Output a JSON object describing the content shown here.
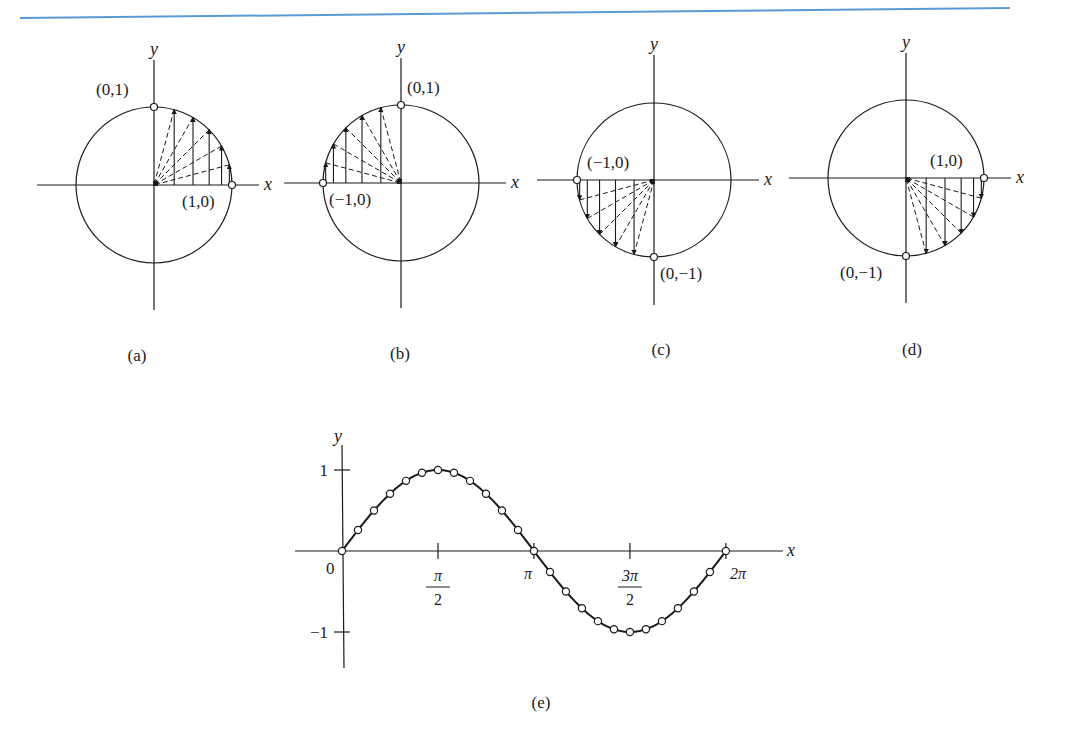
{
  "header_rule": {
    "color": "#5b9bd5"
  },
  "panels": [
    {
      "id": "a",
      "caption": "(a)",
      "cx": 154,
      "cy": 185,
      "r": 78,
      "axis_x_label": "x",
      "axis_y_label": "y",
      "quadrant": "I",
      "points": [
        {
          "label": "(0,1)",
          "angle_deg": 90,
          "label_dx": -58,
          "label_dy": -12
        },
        {
          "label": "(1,0)",
          "angle_deg": 0,
          "label_dx": -50,
          "label_dy": 22
        }
      ],
      "projection_angles_deg": [
        15,
        30,
        45,
        60,
        75
      ]
    },
    {
      "id": "b",
      "caption": "(b)",
      "cx": 401,
      "cy": 183,
      "r": 78,
      "axis_x_label": "x",
      "axis_y_label": "y",
      "quadrant": "II",
      "points": [
        {
          "label": "(0,1)",
          "angle_deg": 90,
          "label_dx": 6,
          "label_dy": -12
        },
        {
          "label": "(−1,0)",
          "angle_deg": 180,
          "label_dx": 6,
          "label_dy": 22
        }
      ],
      "projection_angles_deg": [
        105,
        120,
        135,
        150,
        165
      ]
    },
    {
      "id": "c",
      "caption": "(c)",
      "cx": 654,
      "cy": 180,
      "r": 77,
      "axis_x_label": "x",
      "axis_y_label": "y",
      "quadrant": "III",
      "points": [
        {
          "label": "(−1,0)",
          "angle_deg": 180,
          "label_dx": 10,
          "label_dy": -12
        },
        {
          "label": "(0,−1)",
          "angle_deg": 270,
          "label_dx": 6,
          "label_dy": 22
        }
      ],
      "projection_angles_deg": [
        195,
        210,
        225,
        240,
        255
      ]
    },
    {
      "id": "d",
      "caption": "(d)",
      "cx": 906,
      "cy": 178,
      "r": 78,
      "axis_x_label": "x",
      "axis_y_label": "y",
      "quadrant": "IV",
      "points": [
        {
          "label": "(1,0)",
          "angle_deg": 0,
          "label_dx": -54,
          "label_dy": -12
        },
        {
          "label": "(0,−1)",
          "angle_deg": 270,
          "label_dx": -66,
          "label_dy": 22
        }
      ],
      "projection_angles_deg": [
        285,
        300,
        315,
        330,
        345
      ]
    }
  ],
  "sine_plot": {
    "caption": "(e)",
    "axis_x_label": "x",
    "axis_y_label": "y",
    "origin_label": "0",
    "y_ticks": [
      {
        "value": 1,
        "label": "1"
      },
      {
        "value": -1,
        "label": "−1"
      }
    ],
    "x_ticks": [
      {
        "value": 1.5708,
        "num": "π",
        "den": "2"
      },
      {
        "value": 3.1416,
        "label": "π"
      },
      {
        "value": 4.7124,
        "num": "3π",
        "den": "2"
      },
      {
        "value": 6.2832,
        "label": "2π"
      }
    ]
  },
  "chart_data": {
    "type": "line",
    "title": "",
    "xlabel": "x",
    "ylabel": "y",
    "xlim": [
      0,
      6.2832
    ],
    "ylim": [
      -1,
      1
    ],
    "grid": false,
    "x_tick_labels": [
      "0",
      "π/2",
      "π",
      "3π/2",
      "2π"
    ],
    "y_tick_labels": [
      "1",
      "−1"
    ],
    "series": [
      {
        "name": "y = sin x",
        "x": [
          0,
          0.2618,
          0.5236,
          0.7854,
          1.0472,
          1.309,
          1.5708,
          1.8326,
          2.0944,
          2.3562,
          2.618,
          2.8798,
          3.1416,
          3.4034,
          3.6652,
          3.927,
          4.1888,
          4.4506,
          4.7124,
          4.9742,
          5.236,
          5.4978,
          5.7596,
          6.0214,
          6.2832
        ],
        "values": [
          0,
          0.259,
          0.5,
          0.707,
          0.866,
          0.966,
          1,
          0.966,
          0.866,
          0.707,
          0.5,
          0.259,
          0,
          -0.259,
          -0.5,
          -0.707,
          -0.866,
          -0.966,
          -1,
          -0.966,
          -0.866,
          -0.707,
          -0.5,
          -0.259,
          0
        ]
      }
    ],
    "markers": "open circles at sampled points"
  }
}
